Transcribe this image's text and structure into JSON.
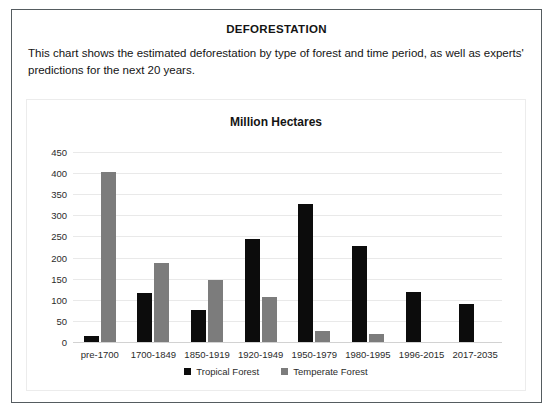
{
  "document": {
    "title": "DEFORESTATION",
    "description": "This chart shows the estimated deforestation by type of forest and time period, as well as experts' predictions for the next 20 years."
  },
  "colors": {
    "tropical": "#0c0c0c",
    "temperate": "#7c7c7c",
    "card_border": "#555c60",
    "panel_border": "#ececec",
    "gridline": "#e9e9e9",
    "text": "#141414"
  },
  "chart_data": {
    "type": "bar",
    "title": "Million Hectares",
    "xlabel": "",
    "ylabel": "",
    "ylim": [
      0,
      450
    ],
    "ytick_step": 50,
    "yticks": [
      450,
      400,
      350,
      300,
      250,
      200,
      150,
      100,
      50,
      0
    ],
    "grid": true,
    "legend_position": "bottom",
    "categories": [
      "pre-1700",
      "1700-1849",
      "1850-1919",
      "1920-1949",
      "1950-1979",
      "1980-1995",
      "1996-2015",
      "2017-2035"
    ],
    "series": [
      {
        "name": "Tropical Forest",
        "color": "#0c0c0c",
        "values": [
          15,
          117,
          76,
          245,
          327,
          228,
          118,
          90
        ]
      },
      {
        "name": "Temperate Forest",
        "color": "#7c7c7c",
        "values": [
          403,
          188,
          148,
          107,
          25,
          18,
          0,
          0
        ]
      }
    ]
  }
}
